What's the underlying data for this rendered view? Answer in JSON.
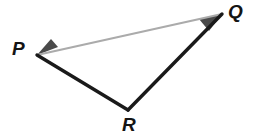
{
  "figure": {
    "kind": "geometry-diagram",
    "name": "triangle-PQR",
    "canvas": {
      "width": 261,
      "height": 138,
      "background": "#ffffff"
    },
    "vertices": [
      {
        "id": "P",
        "label": "P",
        "x": 37,
        "y": 55,
        "label_x": 12,
        "label_y": 39
      },
      {
        "id": "Q",
        "label": "Q",
        "x": 222,
        "y": 14,
        "label_x": 228,
        "label_y": 2
      },
      {
        "id": "R",
        "label": "R",
        "x": 128,
        "y": 110,
        "label_x": 122,
        "label_y": 115
      }
    ],
    "sides": [
      {
        "id": "PQ",
        "from": "P",
        "to": "Q",
        "color": "#ababab",
        "width": 2.2,
        "style": "light"
      },
      {
        "id": "QR",
        "from": "Q",
        "to": "R",
        "color": "#1a1a1a",
        "width": 3.4,
        "style": "bold"
      },
      {
        "id": "RP",
        "from": "R",
        "to": "P",
        "color": "#1a1a1a",
        "width": 3.4,
        "style": "bold"
      }
    ],
    "angle_markers": [
      {
        "id": "angle-P",
        "at": "P",
        "color": "#4a4a4a",
        "points": "37,55 58,47 51,39"
      },
      {
        "id": "angle-Q",
        "at": "Q",
        "color": "#4a4a4a",
        "points": "222,14 199,19 209,31"
      }
    ]
  }
}
